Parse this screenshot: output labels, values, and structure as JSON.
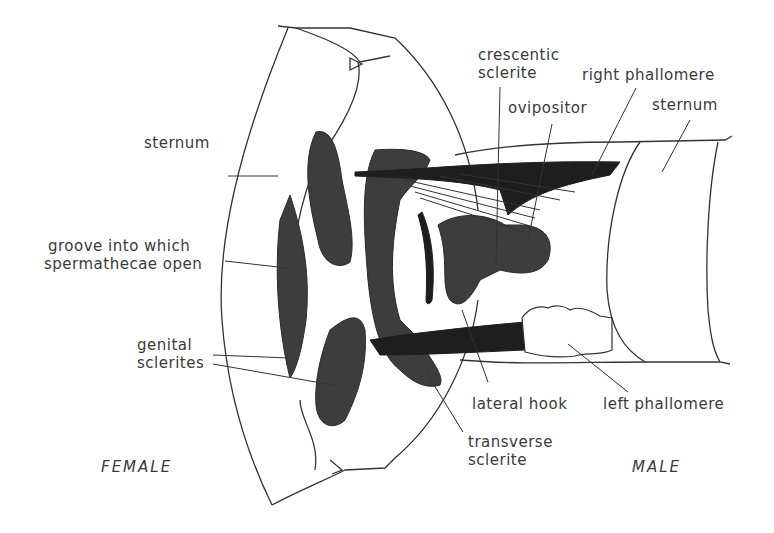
{
  "figure": {
    "sides": {
      "female": "FEMALE",
      "male": "MALE"
    },
    "labels": {
      "sternum_female": "sternum",
      "groove_line1": "groove into which",
      "groove_line2": "spermathecae open",
      "genital_line1": "genital",
      "genital_line2": "sclerites",
      "crescentic_line1": "crescentic",
      "crescentic_line2": "sclerite",
      "ovipositor": "ovipositor",
      "right_phallomere": "right phallomere",
      "sternum_male": "sternum",
      "lateral_hook": "lateral hook",
      "left_phallomere": "left phallomere",
      "transverse_line1": "transverse",
      "transverse_line2": "sclerite"
    },
    "colors": {
      "ink": "#333333",
      "stipple": "#3d3d3d",
      "solid": "#1e1e1e",
      "background": "#ffffff"
    }
  }
}
